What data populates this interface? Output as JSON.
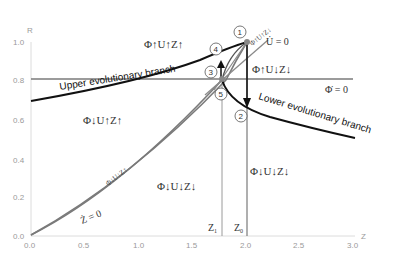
{
  "axes": {
    "y_label": "R",
    "x_label": "Z",
    "y_ticks": [
      "1.0",
      "0.8",
      "0.6",
      "0.4",
      "0.2",
      "0.0"
    ],
    "x_ticks": [
      "0.0",
      "0.5",
      "1.0",
      "1.5",
      "2.0",
      "2.5",
      "3.0"
    ]
  },
  "regions": {
    "top": "Φ↑U↑Z↑",
    "right_upper": "Φ↑U↓Z↓",
    "left_middle": "Φ↓U↑Z↑",
    "bottom_center": "Φ↓U↓Z↓",
    "bottom_right": "Φ↓U↓Z↓",
    "narrow_band": "Φ↓U↓Z↑",
    "diagonal_top": "Φ↑U↑Z↓"
  },
  "nullclines": {
    "u": "U̇ = 0",
    "phi": "Φ̇ = 0",
    "z": "Ż = 0"
  },
  "branches": {
    "upper": "Upper evolutionary branch",
    "lower": "Lower evolutionary branch"
  },
  "points": [
    "1",
    "2",
    "3",
    "4",
    "5"
  ],
  "markers": {
    "z1": "Z",
    "z1_sub": "1",
    "z0": "Z",
    "z0_sub": "0"
  },
  "colors": {
    "nullcline": "#7a7a7a",
    "branch": "#111111",
    "axis": "#cfcfcf",
    "tick_text": "#9a9a9a"
  }
}
